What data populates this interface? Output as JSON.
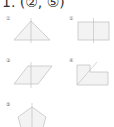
{
  "answer": {
    "text": "1. (②, ⑤)"
  },
  "items": [
    {
      "label": "①",
      "shape": "triangle-icon",
      "description": "isosceles triangle with vertical axis of symmetry"
    },
    {
      "label": "②",
      "shape": "rectangle-icon",
      "description": "rectangle with vertical axis of symmetry"
    },
    {
      "label": "③",
      "shape": "parallelogram-icon",
      "description": "parallelogram with vertical line"
    },
    {
      "label": "④",
      "shape": "l-shape-icon",
      "description": "L-shaped figure with diagonal line"
    },
    {
      "label": "⑤",
      "shape": "pentagon-icon",
      "description": "regular pentagon with vertical axis of symmetry"
    }
  ],
  "colors": {
    "fill": "#f3f3f3",
    "stroke": "#c4c4c4",
    "axis": "#bbbbbb"
  }
}
